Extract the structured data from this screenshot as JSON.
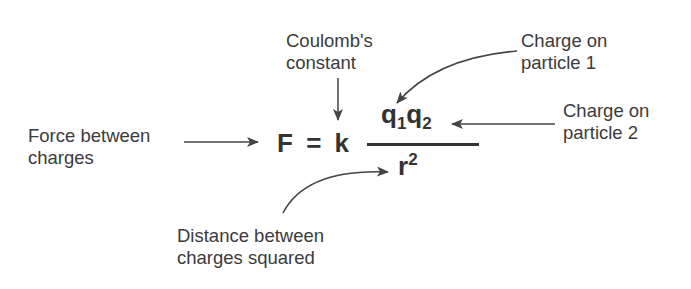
{
  "diagram": {
    "equation": {
      "lhs": "F",
      "equals": "=",
      "constant": "k",
      "numerator": {
        "q1": "q",
        "q1_sub": "1",
        "q2": "q",
        "q2_sub": "2"
      },
      "denominator": {
        "base": "r",
        "exponent": "2"
      }
    },
    "labels": {
      "force": {
        "line1": "Force between",
        "line2": "charges"
      },
      "constant": {
        "line1": "Coulomb's",
        "line2": "constant"
      },
      "charge1": {
        "line1": "Charge on",
        "line2": "particle 1"
      },
      "charge2": {
        "line1": "Charge on",
        "line2": "particle 2"
      },
      "distance": {
        "line1": "Distance between",
        "line2": "charges squared"
      }
    },
    "colors": {
      "text": "#3b3b3b",
      "arrow": "#444444",
      "background": "#ffffff"
    }
  }
}
